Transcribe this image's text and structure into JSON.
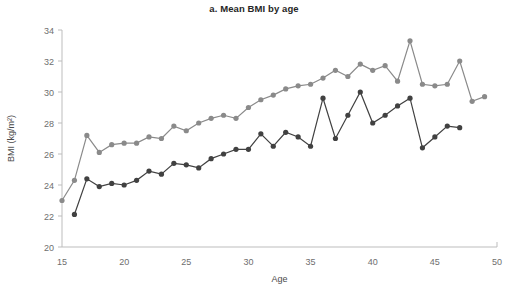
{
  "chart_data": {
    "type": "line",
    "title": "a. Mean BMI by age",
    "xlabel": "Age",
    "ylabel": "BMI (kg/m²)",
    "xlim": [
      15,
      50
    ],
    "ylim": [
      20,
      34
    ],
    "xticks": [
      15,
      20,
      25,
      30,
      35,
      40,
      45,
      50
    ],
    "yticks": [
      20,
      22,
      24,
      26,
      28,
      30,
      32,
      34
    ],
    "grid": false,
    "legend": "none",
    "colors": {
      "series_upper": "#8a8a8a",
      "series_lower": "#414141",
      "axis": "#bdbdbd",
      "title": "#262626",
      "tick_text": "#6e6e6e"
    },
    "series": [
      {
        "name": "upper",
        "color": "#8a8a8a",
        "x": [
          15,
          16,
          17,
          18,
          19,
          20,
          21,
          22,
          23,
          24,
          25,
          26,
          27,
          28,
          29,
          30,
          31,
          32,
          33,
          34,
          35,
          36,
          37,
          38,
          39,
          40,
          41,
          42,
          43,
          44,
          45,
          46,
          47,
          48,
          49
        ],
        "y": [
          23.0,
          24.3,
          27.2,
          26.1,
          26.6,
          26.7,
          26.7,
          27.1,
          27.0,
          27.8,
          27.5,
          28.0,
          28.3,
          28.5,
          28.3,
          29.0,
          29.5,
          29.8,
          30.2,
          30.4,
          30.5,
          30.9,
          31.4,
          31.0,
          31.8,
          31.4,
          31.7,
          30.7,
          33.3,
          30.5,
          30.4,
          30.5,
          32.0,
          29.4,
          29.7
        ]
      },
      {
        "name": "lower",
        "color": "#414141",
        "x": [
          16,
          17,
          18,
          19,
          20,
          21,
          22,
          23,
          24,
          25,
          26,
          27,
          28,
          29,
          30,
          31,
          32,
          33,
          34,
          35,
          36,
          37,
          38,
          39,
          40,
          41,
          42,
          43,
          44,
          45,
          46,
          47
        ],
        "y": [
          22.1,
          24.4,
          23.9,
          24.1,
          24.0,
          24.3,
          24.9,
          24.7,
          25.4,
          25.3,
          25.1,
          25.7,
          26.0,
          26.3,
          26.3,
          27.3,
          26.5,
          27.4,
          27.1,
          26.5,
          29.6,
          27.0,
          28.5,
          30.0,
          28.0,
          28.5,
          29.1,
          29.6,
          26.4,
          27.1,
          27.8,
          27.7
        ]
      }
    ]
  }
}
